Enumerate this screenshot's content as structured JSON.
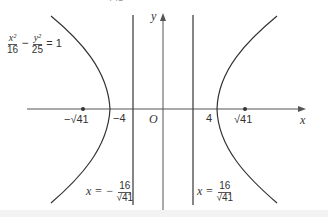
{
  "figure": {
    "equation": {
      "num1": "x²",
      "den1": "16",
      "minus": "−",
      "num2": "y²",
      "den2": "25",
      "rhs": "= 1"
    },
    "axes": {
      "x_label": "x",
      "y_label": "y",
      "origin_label": "O"
    },
    "ticks": {
      "neg_vertex": "−4",
      "pos_vertex": "4",
      "neg_focus": "−√41",
      "pos_focus": "√41"
    },
    "directrix_left": {
      "lhs": "x = −",
      "num": "16",
      "den": "√41"
    },
    "directrix_right": {
      "lhs": "x =",
      "num": "16",
      "den": "√41"
    },
    "top_cut_text": "√41",
    "colors": {
      "curve": "#333333",
      "axis": "#555555",
      "line": "#444444"
    }
  }
}
